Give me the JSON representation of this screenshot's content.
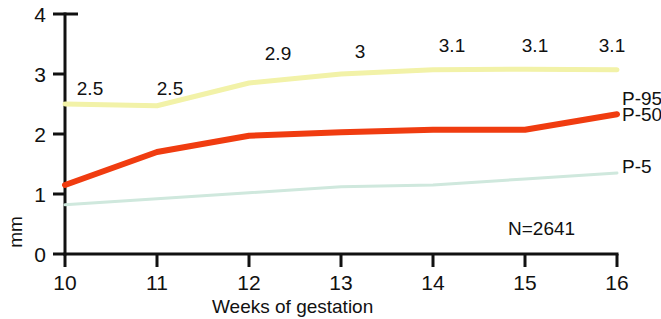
{
  "chart_data": {
    "type": "line",
    "title": "",
    "xlabel": "Weeks of gestation",
    "ylabel": "mm",
    "x": [
      10,
      11,
      12,
      13,
      14,
      15,
      16
    ],
    "xtick_labels": [
      "10",
      "11",
      "12",
      "13",
      "14",
      "15",
      "16"
    ],
    "ytick_labels": [
      "0",
      "1",
      "2",
      "3",
      "4"
    ],
    "yticks": [
      0,
      1,
      2,
      3,
      4
    ],
    "xlim": [
      10,
      16
    ],
    "ylim": [
      0,
      4
    ],
    "grid": false,
    "legend_position": "right-inline",
    "series": [
      {
        "name": "P-95",
        "color": "#f2f2a8",
        "values": [
          2.5,
          2.47,
          2.85,
          3.0,
          3.07,
          3.08,
          3.07
        ],
        "data_labels": [
          "2.5",
          "2.5",
          "2.9",
          "3",
          "3.1",
          "3.1",
          "3.1"
        ]
      },
      {
        "name": "P-50",
        "color": "#f03c10",
        "values": [
          1.15,
          1.7,
          1.97,
          2.03,
          2.07,
          2.07,
          2.33
        ],
        "data_labels": [
          "",
          "",
          "",
          "",
          "",
          "",
          ""
        ]
      },
      {
        "name": "P-5",
        "color": "#cfe8dd",
        "values": [
          0.82,
          0.92,
          1.02,
          1.12,
          1.15,
          1.25,
          1.35
        ],
        "data_labels": [
          "",
          "",
          "",
          "",
          "",
          "",
          ""
        ]
      }
    ],
    "annotations": [
      {
        "name": "sample-size",
        "text": "N=2641"
      }
    ]
  },
  "axis": {
    "y_title": "mm",
    "x_title": "Weeks of gestation",
    "y_ticks": [
      "4",
      "3",
      "2",
      "1",
      "0"
    ],
    "x_ticks": [
      "10",
      "11",
      "12",
      "13",
      "14",
      "15",
      "16"
    ]
  },
  "labels": {
    "p95_top": [
      "2.5",
      "2.5",
      "2.9",
      "3",
      "3.1",
      "3.1",
      "3.1"
    ]
  },
  "legend": {
    "p95": "P-95",
    "p50": "P-50",
    "p5": "P-5"
  },
  "annotation": {
    "sample_size": "N=2641"
  },
  "colors": {
    "p95": "#f2f2a8",
    "p50": "#f03c10",
    "p5": "#cfe8dd",
    "axis": "#111111",
    "background": "#ffffff"
  }
}
